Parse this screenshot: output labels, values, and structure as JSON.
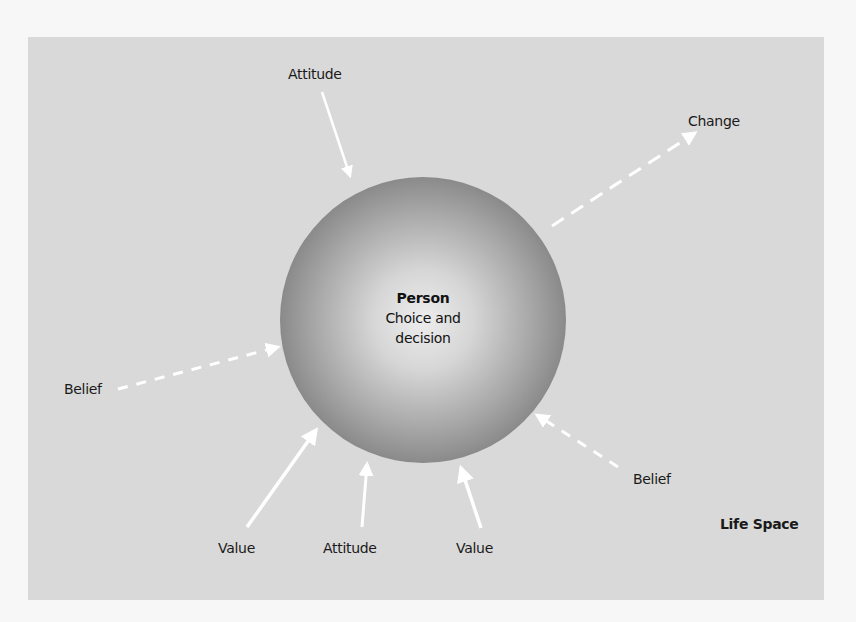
{
  "diagram": {
    "title": "Life Space",
    "center": {
      "title": "Person",
      "line1": "Choice and",
      "line2": "decision"
    },
    "labels": {
      "attitude_top": "Attitude",
      "change": "Change",
      "belief_left": "Belief",
      "belief_right": "Belief",
      "value_left": "Value",
      "attitude_bottom": "Attitude",
      "value_right": "Value"
    },
    "arrows": [
      {
        "from": "Attitude (top)",
        "to": "Person",
        "style": "solid"
      },
      {
        "from": "Person",
        "to": "Change",
        "style": "dashed"
      },
      {
        "from": "Belief (left)",
        "to": "Person",
        "style": "dashed"
      },
      {
        "from": "Belief (right)",
        "to": "Person",
        "style": "dashed"
      },
      {
        "from": "Value (left)",
        "to": "Person",
        "style": "solid"
      },
      {
        "from": "Attitude (bottom)",
        "to": "Person",
        "style": "solid"
      },
      {
        "from": "Value (right)",
        "to": "Person",
        "style": "solid"
      }
    ],
    "colors": {
      "background_panel": "#d9d9d9",
      "sphere_center": "#ececec",
      "sphere_edge": "#888888",
      "arrow": "#ffffff",
      "text": "#1a1a1a"
    }
  }
}
